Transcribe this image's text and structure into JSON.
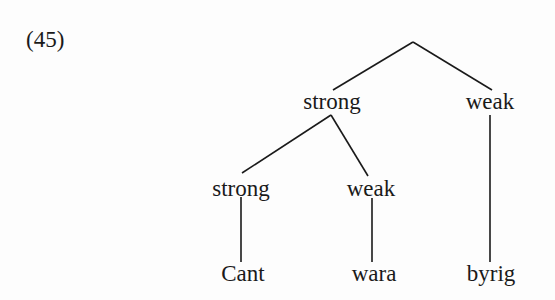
{
  "example_number": "(45)",
  "tree": {
    "root": {
      "label": ""
    },
    "level1": [
      {
        "label": "strong"
      },
      {
        "label": "weak"
      }
    ],
    "level2": [
      {
        "label": "strong"
      },
      {
        "label": "weak"
      }
    ],
    "leaves": [
      {
        "label": "Cant"
      },
      {
        "label": "wara"
      },
      {
        "label": "byrig"
      }
    ]
  }
}
